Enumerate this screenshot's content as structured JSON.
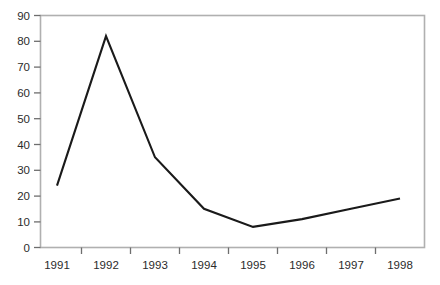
{
  "chart_data": {
    "type": "line",
    "title": "",
    "subtitle": "",
    "xlabel": "",
    "ylabel": "",
    "categories": [
      "1991",
      "1992",
      "1993",
      "1994",
      "1995",
      "1996",
      "1997",
      "1998"
    ],
    "values": [
      24,
      82,
      35,
      15,
      8,
      11,
      15,
      19
    ],
    "series": [
      {
        "name": "",
        "values": [
          24,
          82,
          35,
          15,
          8,
          11,
          15,
          19
        ]
      }
    ],
    "ylim": [
      0,
      90
    ],
    "yticks": [
      0,
      10,
      20,
      30,
      40,
      50,
      60,
      70,
      80,
      90
    ],
    "ytick_labels": [
      "0",
      "10",
      "20",
      "30",
      "40",
      "50",
      "60",
      "70",
      "80",
      "90"
    ],
    "xtick_labels": [
      "1991",
      "1992",
      "1993",
      "1994",
      "1995",
      "1996",
      "1997",
      "1998"
    ],
    "grid": false,
    "legend": false,
    "legend_position": "none",
    "markers": false,
    "line_color": "#1a1a1a",
    "frame_color": "#b0b0b0",
    "tick_color": "#6e6e6e",
    "text_color": "#2b2b2b",
    "background_color": "#ffffff"
  },
  "axes": {
    "y_labels": [
      "90",
      "80",
      "70",
      "60",
      "50",
      "40",
      "30",
      "20",
      "10",
      "0"
    ],
    "x_labels": [
      "1991",
      "1992",
      "1993",
      "1994",
      "1995",
      "1996",
      "1997",
      "1998"
    ]
  }
}
